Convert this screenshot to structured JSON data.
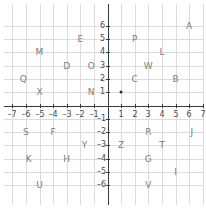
{
  "chart_data": {
    "type": "scatter",
    "title": "",
    "xlabel": "",
    "ylabel": "",
    "xlim": [
      -7,
      7
    ],
    "ylim": [
      -6.5,
      6.5
    ],
    "grid": true,
    "legend": false,
    "x_ticks": [
      -7,
      -6,
      -5,
      -4,
      -3,
      -2,
      -1,
      1,
      2,
      3,
      4,
      5,
      6,
      7
    ],
    "x_tick_labels": [
      "–7",
      "–6",
      "–5",
      "–4",
      "–3",
      "–2",
      "–1",
      "1",
      "2",
      "3",
      "4",
      "5",
      "6",
      "7"
    ],
    "y_ticks": [
      6,
      5,
      4,
      3,
      2,
      1,
      -1,
      -2,
      -3,
      -4,
      -5,
      -6
    ],
    "y_tick_labels": [
      "6",
      "5",
      "4",
      "3",
      "2",
      "1",
      "–1",
      "–2",
      "–3",
      "–4",
      "–5",
      "–6"
    ],
    "markers": [
      {
        "label": "",
        "x": 1,
        "y": 1
      }
    ],
    "labeled_points": [
      {
        "label": "A",
        "x": 6,
        "y": 6
      },
      {
        "label": "E",
        "x": -2,
        "y": 5
      },
      {
        "label": "P",
        "x": 2,
        "y": 5
      },
      {
        "label": "M",
        "x": -5,
        "y": 4
      },
      {
        "label": "L",
        "x": 4,
        "y": 4
      },
      {
        "label": "D",
        "x": -3,
        "y": 3
      },
      {
        "label": "O",
        "x": -1.2,
        "y": 3
      },
      {
        "label": "W",
        "x": 3,
        "y": 3
      },
      {
        "label": "Q",
        "x": -6.2,
        "y": 2
      },
      {
        "label": "C",
        "x": 2,
        "y": 2
      },
      {
        "label": "B",
        "x": 5,
        "y": 2
      },
      {
        "label": "X",
        "x": -5,
        "y": 1
      },
      {
        "label": "N",
        "x": -1.2,
        "y": 1
      },
      {
        "label": "S",
        "x": -6,
        "y": -2
      },
      {
        "label": "F",
        "x": -4,
        "y": -2
      },
      {
        "label": "R",
        "x": 3,
        "y": -2
      },
      {
        "label": "J",
        "x": 6.2,
        "y": -2
      },
      {
        "label": "Y",
        "x": -1.7,
        "y": -3
      },
      {
        "label": "Z",
        "x": 1,
        "y": -3
      },
      {
        "label": "T",
        "x": 4,
        "y": -3
      },
      {
        "label": "K",
        "x": -5.8,
        "y": -4
      },
      {
        "label": "H",
        "x": -3,
        "y": -4
      },
      {
        "label": "G",
        "x": 3,
        "y": -4
      },
      {
        "label": "I",
        "x": 5,
        "y": -5
      },
      {
        "label": "U",
        "x": -5,
        "y": -6
      },
      {
        "label": "V",
        "x": 3,
        "y": -6
      }
    ],
    "colors": {
      "grid": "#dcdcdc",
      "axis": "#3a3a3a",
      "tick_text": "#4a4a4a",
      "point_label": "#7d7d7d",
      "marker": "#2b2b2b",
      "background": "#ffffff"
    }
  }
}
